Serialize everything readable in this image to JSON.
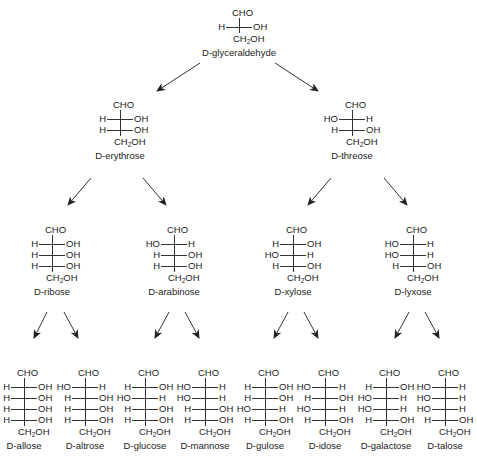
{
  "diagram": {
    "colors": {
      "text": "#222222",
      "lines": "#333333",
      "background": "#ffffff"
    },
    "top_group": "CHO",
    "bottom_group": "CH2OH",
    "molecules": [
      {
        "id": "glyceraldehyde",
        "name": "D-glyceraldehyde",
        "x": 239,
        "y": 8,
        "rows": [
          [
            "H",
            "OH"
          ]
        ]
      },
      {
        "id": "erythrose",
        "name": "D-erythrose",
        "x": 120,
        "y": 100,
        "rows": [
          [
            "H",
            "OH"
          ],
          [
            "H",
            "OH"
          ]
        ]
      },
      {
        "id": "threose",
        "name": "D-threose",
        "x": 352,
        "y": 100,
        "rows": [
          [
            "HO",
            "H"
          ],
          [
            "H",
            "OH"
          ]
        ]
      },
      {
        "id": "ribose",
        "name": "D-ribose",
        "x": 52,
        "y": 225,
        "rows": [
          [
            "H",
            "OH"
          ],
          [
            "H",
            "OH"
          ],
          [
            "H",
            "OH"
          ]
        ]
      },
      {
        "id": "arabinose",
        "name": "D-arabinose",
        "x": 174,
        "y": 225,
        "rows": [
          [
            "HO",
            "H"
          ],
          [
            "H",
            "OH"
          ],
          [
            "H",
            "OH"
          ]
        ]
      },
      {
        "id": "xylose",
        "name": "D-xylose",
        "x": 293,
        "y": 225,
        "rows": [
          [
            "H",
            "OH"
          ],
          [
            "HO",
            "H"
          ],
          [
            "H",
            "OH"
          ]
        ]
      },
      {
        "id": "lyxose",
        "name": "D-lyxose",
        "x": 413,
        "y": 225,
        "rows": [
          [
            "HO",
            "H"
          ],
          [
            "HO",
            "H"
          ],
          [
            "H",
            "OH"
          ]
        ]
      },
      {
        "id": "allose",
        "name": "D-allose",
        "x": 24,
        "y": 368,
        "rows": [
          [
            "H",
            "OH"
          ],
          [
            "H",
            "OH"
          ],
          [
            "H",
            "OH"
          ],
          [
            "H",
            "OH"
          ]
        ]
      },
      {
        "id": "altrose",
        "name": "D-altrose",
        "x": 85,
        "y": 368,
        "rows": [
          [
            "HO",
            "H"
          ],
          [
            "H",
            "OH"
          ],
          [
            "H",
            "OH"
          ],
          [
            "H",
            "OH"
          ]
        ]
      },
      {
        "id": "glucose",
        "name": "D-glucose",
        "x": 145,
        "y": 368,
        "rows": [
          [
            "H",
            "OH"
          ],
          [
            "HO",
            "H"
          ],
          [
            "H",
            "OH"
          ],
          [
            "H",
            "OH"
          ]
        ]
      },
      {
        "id": "mannose",
        "name": "D-mannose",
        "x": 205,
        "y": 368,
        "rows": [
          [
            "HO",
            "H"
          ],
          [
            "HO",
            "H"
          ],
          [
            "H",
            "OH"
          ],
          [
            "H",
            "OH"
          ]
        ]
      },
      {
        "id": "gulose",
        "name": "D-gulose",
        "x": 265,
        "y": 368,
        "rows": [
          [
            "H",
            "OH"
          ],
          [
            "H",
            "OH"
          ],
          [
            "HO",
            "H"
          ],
          [
            "H",
            "OH"
          ]
        ]
      },
      {
        "id": "idose",
        "name": "D-idose",
        "x": 325,
        "y": 368,
        "rows": [
          [
            "HO",
            "H"
          ],
          [
            "H",
            "OH"
          ],
          [
            "HO",
            "H"
          ],
          [
            "H",
            "OH"
          ]
        ]
      },
      {
        "id": "galactose",
        "name": "D-galactose",
        "x": 386,
        "y": 368,
        "rows": [
          [
            "H",
            "OH"
          ],
          [
            "HO",
            "H"
          ],
          [
            "HO",
            "H"
          ],
          [
            "H",
            "OH"
          ]
        ]
      },
      {
        "id": "talose",
        "name": "D-talose",
        "x": 445,
        "y": 368,
        "rows": [
          [
            "HO",
            "H"
          ],
          [
            "HO",
            "H"
          ],
          [
            "HO",
            "H"
          ],
          [
            "H",
            "OH"
          ]
        ]
      }
    ],
    "arrows": [
      {
        "from": "glyceraldehyde",
        "to": "erythrose",
        "x1": 200,
        "y1": 63,
        "x2": 157,
        "y2": 91
      },
      {
        "from": "glyceraldehyde",
        "to": "threose",
        "x1": 275,
        "y1": 63,
        "x2": 318,
        "y2": 91
      },
      {
        "from": "erythrose",
        "to": "ribose",
        "x1": 91,
        "y1": 178,
        "x2": 68,
        "y2": 205
      },
      {
        "from": "erythrose",
        "to": "arabinose",
        "x1": 143,
        "y1": 178,
        "x2": 166,
        "y2": 205
      },
      {
        "from": "threose",
        "to": "xylose",
        "x1": 331,
        "y1": 178,
        "x2": 308,
        "y2": 205
      },
      {
        "from": "threose",
        "to": "lyxose",
        "x1": 384,
        "y1": 178,
        "x2": 407,
        "y2": 205
      },
      {
        "from": "ribose",
        "to": "allose",
        "x1": 47,
        "y1": 312,
        "x2": 34,
        "y2": 338
      },
      {
        "from": "ribose",
        "to": "altrose",
        "x1": 64,
        "y1": 312,
        "x2": 78,
        "y2": 338
      },
      {
        "from": "arabinose",
        "to": "glucose",
        "x1": 169,
        "y1": 312,
        "x2": 155,
        "y2": 338
      },
      {
        "from": "arabinose",
        "to": "mannose",
        "x1": 185,
        "y1": 312,
        "x2": 199,
        "y2": 338
      },
      {
        "from": "xylose",
        "to": "gulose",
        "x1": 288,
        "y1": 312,
        "x2": 274,
        "y2": 338
      },
      {
        "from": "xylose",
        "to": "idose",
        "x1": 304,
        "y1": 312,
        "x2": 318,
        "y2": 338
      },
      {
        "from": "lyxose",
        "to": "galactose",
        "x1": 409,
        "y1": 312,
        "x2": 395,
        "y2": 338
      },
      {
        "from": "lyxose",
        "to": "talose",
        "x1": 425,
        "y1": 312,
        "x2": 439,
        "y2": 338
      }
    ]
  }
}
